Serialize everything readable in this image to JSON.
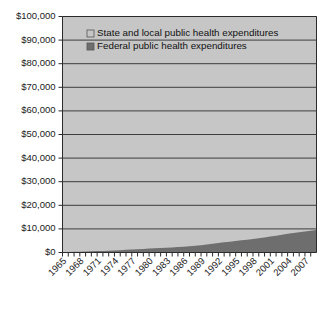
{
  "chart_data": {
    "type": "area",
    "stacked": true,
    "title": "",
    "subtitle": "",
    "xlabel": "",
    "ylabel": "",
    "grid": true,
    "legend_position": "top-center-inside",
    "ylim": [
      0,
      100000
    ],
    "ytick_values": [
      0,
      10000,
      20000,
      30000,
      40000,
      50000,
      60000,
      70000,
      80000,
      90000,
      100000
    ],
    "ytick_labels": [
      "$0",
      "$10,000",
      "$20,000",
      "$30,000",
      "$40,000",
      "$50,000",
      "$60,000",
      "$70,000",
      "$80,000",
      "$90,000",
      "$100,000"
    ],
    "xlim": [
      1965,
      2009
    ],
    "xtick_labels": [
      "1965",
      "1968",
      "1971",
      "1974",
      "1977",
      "1980",
      "1983",
      "1986",
      "1989",
      "1992",
      "1995",
      "1998",
      "2001",
      "2004",
      "2007"
    ],
    "x": [
      1965,
      1966,
      1967,
      1968,
      1969,
      1970,
      1971,
      1972,
      1973,
      1974,
      1975,
      1976,
      1977,
      1978,
      1979,
      1980,
      1981,
      1982,
      1983,
      1984,
      1985,
      1986,
      1987,
      1988,
      1989,
      1990,
      1991,
      1992,
      1993,
      1994,
      1995,
      1996,
      1997,
      1998,
      1999,
      2000,
      2001,
      2002,
      2003,
      2004,
      2005,
      2006,
      2007,
      2008,
      2009
    ],
    "series": [
      {
        "name": "Federal public health expenditures",
        "color": "#6e6e6e",
        "values": [
          200,
          240,
          290,
          350,
          420,
          500,
          590,
          680,
          780,
          880,
          1000,
          1120,
          1250,
          1380,
          1520,
          1680,
          1800,
          1880,
          1980,
          2120,
          2280,
          2450,
          2650,
          2880,
          3120,
          3400,
          3700,
          4000,
          4300,
          4600,
          4900,
          5150,
          5400,
          5700,
          6000,
          6350,
          6750,
          7150,
          7550,
          7900,
          8250,
          8600,
          8950,
          9250,
          9500
        ]
      },
      {
        "name": "State and local public health expenditures",
        "color": "#c6c6c6",
        "values": [
          400,
          480,
          590,
          700,
          840,
          1000,
          1180,
          1370,
          1570,
          1780,
          2010,
          2260,
          2530,
          2830,
          3150,
          3500,
          3830,
          4130,
          4450,
          4820,
          5240,
          5720,
          6320,
          7060,
          7980,
          9100,
          10500,
          12200,
          14200,
          16500,
          19100,
          22000,
          25200,
          28800,
          33000,
          37600,
          42800,
          48400,
          54300,
          60500,
          66800,
          73000,
          79000,
          84000,
          88800
        ]
      }
    ],
    "total_last_value": 89000
  },
  "legend": {
    "entries": [
      {
        "label": "State and local public health expenditures",
        "swatch_color": "#c6c6c6"
      },
      {
        "label": "Federal public health expenditures",
        "swatch_color": "#6e6e6e"
      }
    ]
  },
  "colors": {
    "plot_background": "#c6c6c6",
    "state_local_area": "#c6c6c6",
    "federal_area": "#6e6e6e",
    "gridline": "#3d3d3d",
    "axis": "#2b2b2b",
    "text": "#1a1a1a",
    "page_background": "#ffffff"
  }
}
